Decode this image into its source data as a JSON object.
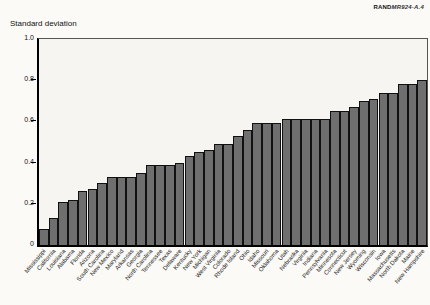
{
  "header": {
    "brand_bold": "RAND",
    "brand_ref": "MR924-A.4"
  },
  "chart_data": {
    "type": "bar",
    "title": "Standard deviation",
    "xlabel": "",
    "ylabel": "Standard deviation",
    "ylim": [
      0,
      1.0
    ],
    "yticks": [
      0,
      0.2,
      0.4,
      0.6,
      0.8,
      1.0
    ],
    "ytick_labels": [
      "0",
      "0.2",
      "0.4",
      "0.6",
      "0.8",
      "1.0"
    ],
    "grid": false,
    "legend": "none",
    "bar_color": "#6f6f6f",
    "bar_edge_color": "#111111",
    "categories": [
      "Mississippi",
      "California",
      "Louisiana",
      "Alabama",
      "Florida",
      "Arizona",
      "South Carolina",
      "New Mexico",
      "Maryland",
      "Arkansas",
      "Georgia",
      "North Carolina",
      "Tennessee",
      "Texas",
      "Delaware",
      "Kentucky",
      "New York",
      "Michigan",
      "West Virginia",
      "Colorado",
      "Rhode Island",
      "Ohio",
      "Idaho",
      "Missouri",
      "Oklahoma",
      "Utah",
      "Nebraska",
      "Virginia",
      "Indiana",
      "Pennsylvania",
      "Minnesota",
      "Connecticut",
      "New Jersey",
      "Wyoming",
      "Wisconsin",
      "Iowa",
      "Massachusetts",
      "North Dakota",
      "Maine",
      "New Hampshire"
    ],
    "values": [
      0.08,
      0.13,
      0.21,
      0.22,
      0.26,
      0.27,
      0.3,
      0.33,
      0.33,
      0.33,
      0.35,
      0.39,
      0.39,
      0.39,
      0.4,
      0.43,
      0.45,
      0.46,
      0.49,
      0.49,
      0.53,
      0.56,
      0.59,
      0.59,
      0.59,
      0.61,
      0.61,
      0.61,
      0.61,
      0.61,
      0.65,
      0.65,
      0.67,
      0.7,
      0.71,
      0.74,
      0.74,
      0.78,
      0.78,
      0.8
    ]
  }
}
